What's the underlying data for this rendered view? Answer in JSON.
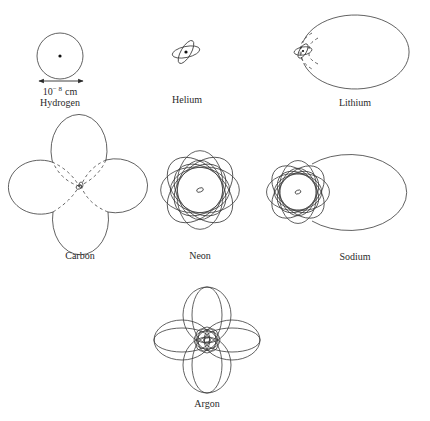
{
  "figure": {
    "atoms": [
      {
        "id": "hydrogen",
        "label": "Hydrogen",
        "scale_label": "10",
        "scale_exp": "− 8",
        "scale_unit": "cm"
      },
      {
        "id": "helium",
        "label": "Helium"
      },
      {
        "id": "lithium",
        "label": "Lithium"
      },
      {
        "id": "carbon",
        "label": "Carbon"
      },
      {
        "id": "neon",
        "label": "Neon"
      },
      {
        "id": "sodium",
        "label": "Sodium"
      },
      {
        "id": "argon",
        "label": "Argon"
      }
    ],
    "colors": {
      "line": "#3a3a3a",
      "text": "#2a2a2a",
      "background": "#ffffff"
    }
  }
}
